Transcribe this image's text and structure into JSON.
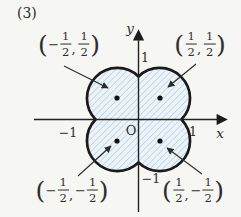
{
  "figure": {
    "index_label": "(3)"
  },
  "colors": {
    "background": "#f6f6f3",
    "region_fill": "#edf4f9",
    "hatch_line": "#bed7e6",
    "outline": "#1a1a1a",
    "axis": "#222222",
    "text": "#2e2e2e",
    "dot": "#111111"
  },
  "axes": {
    "x_label": "x",
    "y_label": "y",
    "origin_label": "O",
    "x_tick_pos": "1",
    "x_tick_neg": "−1",
    "y_tick_pos": "1",
    "y_tick_neg": "−1"
  },
  "point_labels": {
    "top_left": {
      "open": "(",
      "x_sign": "−",
      "x_num": "1",
      "x_den": "2",
      "sep": ",",
      "y_sign": "",
      "y_num": "1",
      "y_den": "2",
      "close": ")"
    },
    "top_right": {
      "open": "(",
      "x_sign": "",
      "x_num": "1",
      "x_den": "2",
      "sep": ",",
      "y_sign": "",
      "y_num": "1",
      "y_den": "2",
      "close": ")"
    },
    "bottom_left": {
      "open": "(",
      "x_sign": "−",
      "x_num": "1",
      "x_den": "2",
      "sep": ",",
      "y_sign": "−",
      "y_num": "1",
      "y_den": "2",
      "close": ")"
    },
    "bottom_right": {
      "open": "(",
      "x_sign": "",
      "x_num": "1",
      "x_den": "2",
      "sep": ",",
      "y_sign": "−",
      "y_num": "1",
      "y_den": "2",
      "close": ")"
    }
  },
  "marked_points": [
    {
      "x": "1/2",
      "y": "1/2"
    },
    {
      "x": "-1/2",
      "y": "1/2"
    },
    {
      "x": "-1/2",
      "y": "-1/2"
    },
    {
      "x": "1/2",
      "y": "-1/2"
    }
  ]
}
